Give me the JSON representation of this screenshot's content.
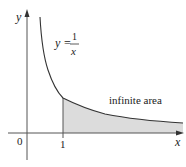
{
  "figure": {
    "axes": {
      "x_label": "x",
      "y_label": "y",
      "origin_label": "0",
      "x_tick_label": "1"
    },
    "curve": {
      "equation_lhs": "y =",
      "numerator": "1",
      "denominator": "x"
    },
    "region": {
      "label": "infinite area",
      "fill_color": "#d9d9d9"
    },
    "colors": {
      "axis": "#555555",
      "curve": "#333333"
    }
  }
}
